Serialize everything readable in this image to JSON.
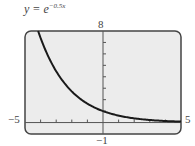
{
  "chart_data": {
    "type": "line",
    "title_base": "y = e",
    "title_exponent": "−0.5x",
    "function": "y = e^(-0.5x)",
    "xlabel": "",
    "ylabel": "",
    "xlim": [
      -5,
      5
    ],
    "ylim": [
      -1,
      8
    ],
    "x_tick_step": 1,
    "y_tick_step": 1,
    "tick_labels": {
      "xmin": "−5",
      "xmax": "5",
      "ymin": "−1",
      "ymax": "8"
    },
    "grid": false,
    "legend": null,
    "series": [
      {
        "name": "y = e^(-0.5x)",
        "x": [
          -4.16,
          -4,
          -3,
          -2,
          -1,
          0,
          1,
          2,
          3,
          4,
          5
        ],
        "values": [
          8.0,
          7.39,
          4.48,
          2.72,
          1.65,
          1.0,
          0.61,
          0.37,
          0.22,
          0.14,
          0.08
        ]
      }
    ],
    "colors": {
      "curve": "#1a1a1a",
      "background": "#ececec",
      "frame": "#444444"
    }
  }
}
